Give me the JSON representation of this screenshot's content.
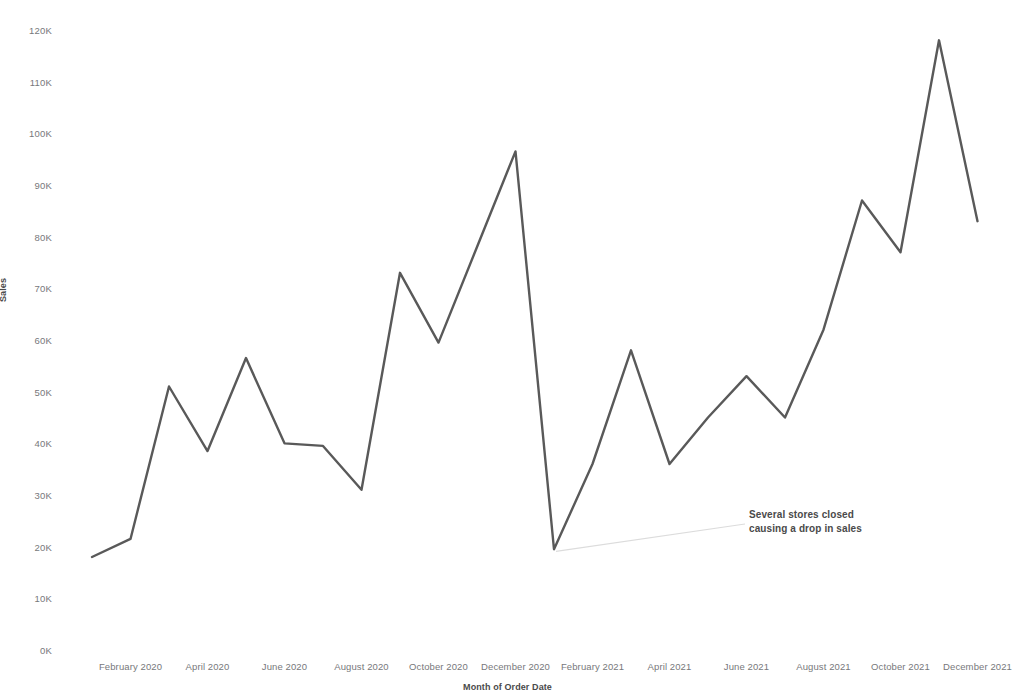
{
  "chart_data": {
    "type": "line",
    "title": "",
    "xlabel": "Month of Order Date",
    "ylabel": "Sales",
    "ylim": [
      0,
      120000
    ],
    "grid": false,
    "legend": "none",
    "line_color": "#595959",
    "y_ticks": [
      "0K",
      "10K",
      "20K",
      "30K",
      "40K",
      "50K",
      "60K",
      "70K",
      "80K",
      "90K",
      "100K",
      "110K",
      "120K"
    ],
    "y_tick_values": [
      0,
      10000,
      20000,
      30000,
      40000,
      50000,
      60000,
      70000,
      80000,
      90000,
      100000,
      110000,
      120000
    ],
    "x_tick_labels": [
      "February 2020",
      "April 2020",
      "June 2020",
      "August 2020",
      "October 2020",
      "December 2020",
      "February 2021",
      "April 2021",
      "June 2021",
      "August 2021",
      "October 2021",
      "December 2021"
    ],
    "categories": [
      "January 2020",
      "February 2020",
      "March 2020",
      "April 2020",
      "May 2020",
      "June 2020",
      "July 2020",
      "August 2020",
      "September 2020",
      "October 2020",
      "November 2020",
      "December 2020",
      "January 2021",
      "February 2021",
      "March 2021",
      "April 2021",
      "May 2021",
      "June 2021",
      "July 2021",
      "August 2021",
      "September 2021",
      "October 2021",
      "November 2021",
      "December 2021"
    ],
    "values": [
      18000,
      21500,
      51000,
      38500,
      56500,
      40000,
      39500,
      31000,
      73000,
      59500,
      78000,
      96500,
      19500,
      36000,
      58000,
      36000,
      45000,
      53000,
      45000,
      62000,
      87000,
      77000,
      118000,
      83000
    ],
    "annotations": [
      {
        "text_line1": "Several stores closed",
        "text_line2": "causing a drop in sales",
        "target_category": "January 2021",
        "target_value": 19500
      }
    ]
  },
  "annotation": {
    "line1": "Several stores closed",
    "line2": "causing a drop in sales"
  }
}
